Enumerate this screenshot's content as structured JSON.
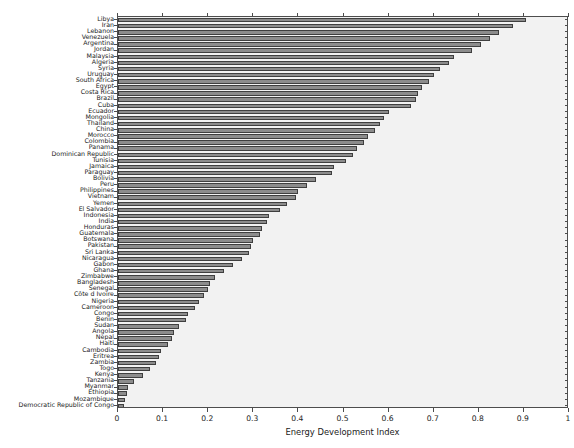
{
  "chart_data": {
    "type": "bar",
    "orientation": "horizontal",
    "title": "",
    "xlabel": "Energy Development Index",
    "ylabel": "",
    "xlim": [
      0,
      1
    ],
    "ylim": [
      0,
      62
    ],
    "grid": false,
    "legend": null,
    "xticks": [
      "0",
      "0.1",
      "0.2",
      "0.3",
      "0.4",
      "0.5",
      "0.6",
      "0.7",
      "0.8",
      "0.9",
      "1"
    ],
    "xtick_values": [
      0,
      0.1,
      0.2,
      0.3,
      0.4,
      0.5,
      0.6,
      0.7,
      0.8,
      0.9,
      1
    ],
    "bar_color": "#8c8c8c",
    "bar_edge_color": "#3f3f3f",
    "plot_background": "#f2f2f2",
    "categories": [
      "Libya",
      "Iran",
      "Lebanon",
      "Venezuela",
      "Argentina",
      "Jordan",
      "Malaysia",
      "Algeria",
      "Syria",
      "Uruguay",
      "South Africa",
      "Egypt",
      "Costa Rica",
      "Brazil",
      "Cuba",
      "Ecuador",
      "Mongolia",
      "Thailand",
      "China",
      "Morocco",
      "Colombia",
      "Panama",
      "Dominican Republic",
      "Tunisia",
      "Jamaica",
      "Paraguay",
      "Bolivia",
      "Peru",
      "Philippines",
      "Vietnam",
      "Yemen",
      "El Salvador",
      "Indonesia",
      "India",
      "Honduras",
      "Guatemala",
      "Botswana",
      "Pakistan",
      "Sri Lanka",
      "Nicaragua",
      "Gabon",
      "Ghana",
      "Zimbabwe",
      "Bangladesh",
      "Senegal",
      "Côte d Ivoire",
      "Nigeria",
      "Cameroon",
      "Congo",
      "Benin",
      "Sudan",
      "Angola",
      "Nepal",
      "Haiti",
      "Cambodia",
      "Eritrea",
      "Zambia",
      "Togo",
      "Kenya",
      "Tanzania",
      "Myanmar",
      "Ethiopia",
      "Mozambique",
      "Democratic Republic of Congo"
    ],
    "values": [
      0.905,
      0.875,
      0.845,
      0.825,
      0.805,
      0.785,
      0.745,
      0.735,
      0.715,
      0.7,
      0.69,
      0.675,
      0.665,
      0.66,
      0.65,
      0.6,
      0.59,
      0.58,
      0.57,
      0.555,
      0.545,
      0.53,
      0.52,
      0.505,
      0.48,
      0.475,
      0.44,
      0.42,
      0.4,
      0.395,
      0.375,
      0.36,
      0.335,
      0.33,
      0.32,
      0.315,
      0.3,
      0.295,
      0.29,
      0.275,
      0.255,
      0.235,
      0.215,
      0.205,
      0.2,
      0.19,
      0.18,
      0.17,
      0.155,
      0.15,
      0.135,
      0.125,
      0.12,
      0.11,
      0.095,
      0.09,
      0.085,
      0.07,
      0.055,
      0.035,
      0.022,
      0.02,
      0.016,
      0.014
    ]
  }
}
